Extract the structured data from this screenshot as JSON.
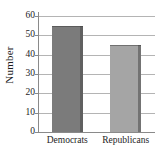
{
  "chart_data": {
    "type": "bar",
    "title": "",
    "xlabel": "",
    "ylabel": "Number",
    "categories": [
      "Democrats",
      "Republicans"
    ],
    "values": [
      55,
      45
    ],
    "ylim": [
      0,
      60
    ],
    "yticks": [
      0,
      10,
      20,
      30,
      40,
      50,
      60
    ],
    "ytick_labels": [
      "0",
      "10",
      "20",
      "30",
      "40",
      "50",
      "60"
    ],
    "grid": "horizontal",
    "legend": "none",
    "bar_colors": [
      "#7b7b7b",
      "#a5a5a5"
    ],
    "axis_color": "#8a8a8a",
    "gridline_color": "#b4b4b4",
    "text_color": "#1d1d1d",
    "background": "#ffffff"
  }
}
